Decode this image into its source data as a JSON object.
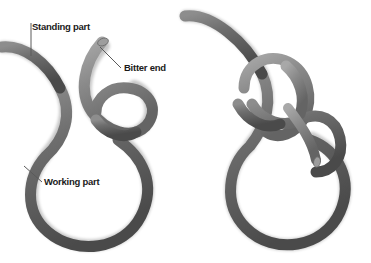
{
  "figure": {
    "background_color": "#ffffff",
    "width": 371,
    "height": 263,
    "panels": [
      {
        "name": "left-panel",
        "caption": "Step 1 - loop with crossing turn"
      },
      {
        "name": "right-panel",
        "caption": "Step 2 - bitter end tucked through loop"
      }
    ]
  },
  "labels": {
    "standing_part": "Standing part",
    "bitter_end": "Bitter end",
    "working_part": "Working part"
  },
  "colors": {
    "rope_dark": "#4d4d4d",
    "rope_mid": "#6b6b6b",
    "rope_light": "#8f8f8f",
    "rope_highlight": "#b3b3b3",
    "rope_shadow": "#3a3a3a",
    "leader_line": "#5a5a5a",
    "text": "#1a1a1a",
    "background": "#ffffff"
  },
  "rope": {
    "stroke_width": 11,
    "end_cap_fill": "#9a9a9a"
  }
}
